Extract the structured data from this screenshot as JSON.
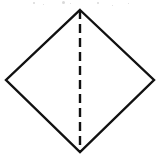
{
  "figure": {
    "canvas": {
      "width": 161,
      "height": 162,
      "background": "#ffffff"
    },
    "shape": {
      "name": "diamond",
      "kind": "square-rotated-45",
      "stroke_color": "#111111",
      "stroke_width": 2.4,
      "fill": "none",
      "vertices": {
        "top": {
          "x": 80,
          "y": 10
        },
        "right": {
          "x": 154,
          "y": 80
        },
        "bottom": {
          "x": 80,
          "y": 152
        },
        "left": {
          "x": 6,
          "y": 80
        }
      },
      "points_attr": "80,10 154,80 80,152 6,80"
    },
    "fold_line": {
      "name": "vertical-fold-line",
      "style": "dashed",
      "stroke_color": "#111111",
      "stroke_width": 2.4,
      "dash_pattern": "9 5",
      "from": {
        "x": 80,
        "y": 10
      },
      "to": {
        "x": 80,
        "y": 152
      }
    },
    "artifacts": [
      {
        "x": 33,
        "y": 2,
        "size": 2
      },
      {
        "x": 43,
        "y": 4,
        "size": 1
      },
      {
        "x": 62,
        "y": 1,
        "size": 3
      },
      {
        "x": 70,
        "y": 3,
        "size": 1
      },
      {
        "x": 97,
        "y": 2,
        "size": 2
      },
      {
        "x": 112,
        "y": 5,
        "size": 1
      },
      {
        "x": 128,
        "y": 3,
        "size": 1
      }
    ]
  }
}
